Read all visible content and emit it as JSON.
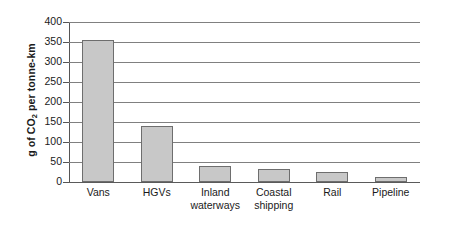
{
  "chart_data": {
    "type": "bar",
    "title": "",
    "xlabel": "",
    "ylabel": "g of CO2 per tonne-km",
    "ylabel_parts": {
      "before": "g of CO",
      "sub": "2",
      "after": " per tonne-km"
    },
    "categories": [
      "Vans",
      "HGVs",
      "Inland waterways",
      "Coastal shipping",
      "Rail",
      "Pipeline"
    ],
    "category_lines": [
      [
        "Vans"
      ],
      [
        "HGVs"
      ],
      [
        "Inland",
        "waterways"
      ],
      [
        "Coastal",
        "shipping"
      ],
      [
        "Rail"
      ],
      [
        "Pipeline"
      ]
    ],
    "values": [
      356,
      139,
      41,
      33,
      25,
      13
    ],
    "ylim": [
      0,
      400
    ],
    "ytick_values": [
      0,
      50,
      100,
      150,
      200,
      250,
      300,
      350,
      400
    ],
    "ytick_labels": [
      "0",
      "50",
      "100",
      "150",
      "200",
      "250",
      "300",
      "350",
      "400"
    ],
    "grid": true,
    "legend": false,
    "bar_color": "#c8c8c8",
    "bar_border_color": "#6e6e6e",
    "grid_color": "#808080",
    "axis_color": "#555555",
    "text_color": "#1a1a1a",
    "background": "#ffffff"
  }
}
